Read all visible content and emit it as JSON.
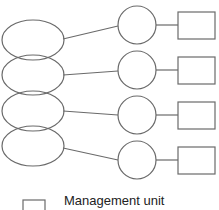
{
  "diagram": {
    "rows": [
      {
        "ellipse": {
          "cx": 33,
          "cy": 40
        },
        "circle": {
          "cx": 137,
          "cy": 25
        },
        "rect": {
          "x": 178,
          "y": 12
        }
      },
      {
        "ellipse": {
          "cx": 33,
          "cy": 75
        },
        "circle": {
          "cx": 137,
          "cy": 70
        },
        "rect": {
          "x": 178,
          "y": 57
        }
      },
      {
        "ellipse": {
          "cx": 33,
          "cy": 111
        },
        "circle": {
          "cx": 137,
          "cy": 115
        },
        "rect": {
          "x": 178,
          "y": 102
        }
      },
      {
        "ellipse": {
          "cx": 33,
          "cy": 146
        },
        "circle": {
          "cx": 137,
          "cy": 160
        },
        "rect": {
          "x": 178,
          "y": 147
        }
      }
    ],
    "colors": {
      "stroke": "#6a6a6a",
      "background": "#ffffff"
    }
  },
  "legend": {
    "items": [
      {
        "symbol": "rectangle",
        "label": "Management unit"
      }
    ]
  }
}
